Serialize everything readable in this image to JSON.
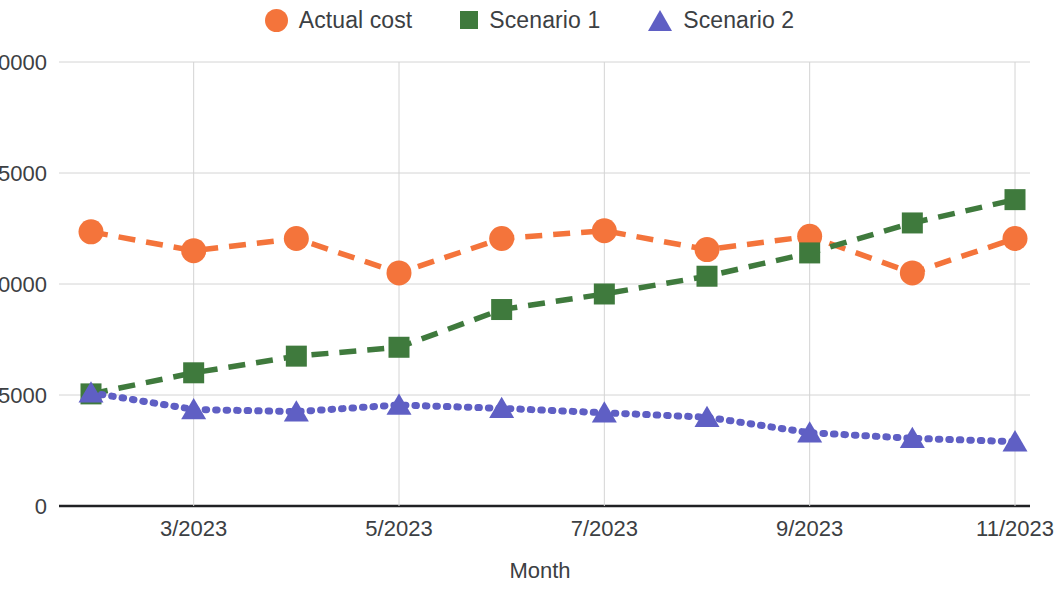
{
  "legend": {
    "position": "top-center",
    "items": [
      {
        "label": "Actual cost",
        "marker": "circle-marker",
        "color": "#f4743b"
      },
      {
        "label": "Scenario 1",
        "marker": "square-marker",
        "color": "#3f7a3d"
      },
      {
        "label": "Scenario 2",
        "marker": "triangle-marker",
        "color": "#5f5fc4"
      }
    ]
  },
  "axes": {
    "x_title": "Month",
    "y_ticks": [
      "0",
      "5000",
      "10000",
      "15000",
      "20000"
    ],
    "x_ticks": [
      "3/2023",
      "5/2023",
      "7/2023",
      "9/2023",
      "11/2023"
    ]
  },
  "chart_data": {
    "type": "line",
    "title": "",
    "xlabel": "Month",
    "ylabel": "",
    "ylim": [
      0,
      20000
    ],
    "yticks": [
      0,
      5000,
      10000,
      15000,
      20000
    ],
    "grid": true,
    "legend_position": "top-center",
    "x": [
      "2/2023",
      "3/2023",
      "4/2023",
      "5/2023",
      "6/2023",
      "7/2023",
      "8/2023",
      "9/2023",
      "10/2023",
      "11/2023"
    ],
    "x_tick_labels": [
      "3/2023",
      "5/2023",
      "7/2023",
      "9/2023",
      "11/2023"
    ],
    "series": [
      {
        "name": "Actual cost",
        "color": "#f4743b",
        "marker": "circle",
        "linestyle": "dashed",
        "values": [
          12350,
          11500,
          12050,
          10500,
          12050,
          12400,
          11550,
          12150,
          10500,
          12050
        ]
      },
      {
        "name": "Scenario 1",
        "color": "#3f7a3d",
        "marker": "square",
        "linestyle": "dashed",
        "values": [
          5050,
          6000,
          6750,
          7150,
          8850,
          9550,
          10350,
          11400,
          12750,
          13800
        ]
      },
      {
        "name": "Scenario 2",
        "color": "#5f5fc4",
        "marker": "triangle",
        "linestyle": "dotted",
        "values": [
          5100,
          4350,
          4250,
          4550,
          4400,
          4200,
          4000,
          3300,
          3050,
          2900
        ]
      }
    ]
  }
}
